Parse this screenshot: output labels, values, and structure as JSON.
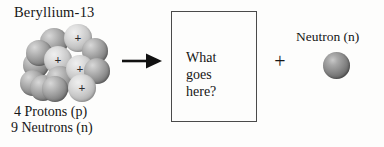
{
  "diagram": {
    "type": "nuclear-reaction",
    "background_color": "#fdfdfc"
  },
  "reactant": {
    "nuclide_label": "Beryllium-13",
    "proton_count_label": "4 Protons (p)",
    "neutron_count_label": "9 Neutrons (n)",
    "protons": 4,
    "neutrons": 9,
    "proton_marker": "+",
    "proton_color": "#d4d4d4",
    "neutron_color": "#8f8f8f",
    "nucleons": [
      {
        "x": 5,
        "y": 30,
        "r": 13,
        "kind": "neutron",
        "plus": false
      },
      {
        "x": 2,
        "y": 48,
        "r": 13,
        "kind": "neutron",
        "plus": false
      },
      {
        "x": 22,
        "y": 6,
        "r": 14,
        "kind": "neutron",
        "plus": false
      },
      {
        "x": 8,
        "y": 18,
        "r": 13,
        "kind": "neutron",
        "plus": false
      },
      {
        "x": 12,
        "y": 53,
        "r": 13,
        "kind": "neutron",
        "plus": false
      },
      {
        "x": 46,
        "y": 2,
        "r": 14,
        "kind": "proton",
        "plus": true
      },
      {
        "x": 64,
        "y": 16,
        "r": 13,
        "kind": "neutron",
        "plus": false
      },
      {
        "x": 26,
        "y": 24,
        "r": 14,
        "kind": "proton",
        "plus": true
      },
      {
        "x": 28,
        "y": 44,
        "r": 14,
        "kind": "neutron",
        "plus": false
      },
      {
        "x": 48,
        "y": 33,
        "r": 14,
        "kind": "proton",
        "plus": true
      },
      {
        "x": 66,
        "y": 36,
        "r": 13,
        "kind": "neutron",
        "plus": false
      },
      {
        "x": 50,
        "y": 52,
        "r": 14,
        "kind": "proton",
        "plus": true
      },
      {
        "x": 24,
        "y": 54,
        "r": 13,
        "kind": "neutron",
        "plus": false
      }
    ]
  },
  "arrow": {
    "name": "reaction-arrow",
    "direction": "right",
    "color": "#111111"
  },
  "product_box": {
    "text": "What\ngoes\nhere?",
    "border_color": "#4a4a4a"
  },
  "operator": {
    "plus": "+"
  },
  "product_particle": {
    "label": "Neutron (n)",
    "color": "#8b8b8b"
  }
}
